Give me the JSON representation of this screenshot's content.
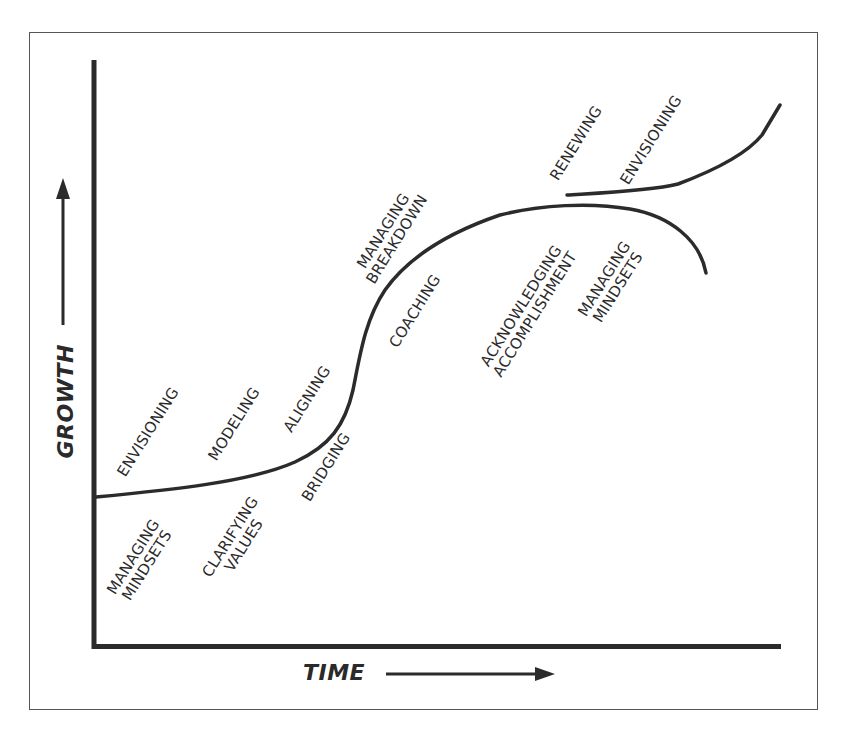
{
  "diagram": {
    "type": "growth-curve",
    "axes": {
      "x_label": "TIME",
      "y_label": "GROWTH"
    },
    "colors": {
      "ink": "#2b2b2b",
      "frame": "#555555",
      "background": "#ffffff"
    },
    "labels_above_curve": {
      "envisioning": "ENVISIONING",
      "modeling": "MODELING",
      "aligning": "ALIGNING",
      "managing_breakdown": [
        "MANAGING",
        "BREAKDOWN"
      ],
      "renewing": "RENEWING",
      "envisioning_2": "ENVISIONING"
    },
    "labels_below_curve": {
      "managing_mindsets": [
        "MANAGING",
        "MINDSETS"
      ],
      "clarifying_values": [
        "CLARIFYING",
        "VALUES"
      ],
      "bridging": "BRIDGING",
      "coaching": "COACHING",
      "acknowledging_accomplishment": [
        "ACKNOWLEDGING",
        "ACCOMPLISHMENT"
      ],
      "managing_mindsets_2": [
        "MANAGING",
        "MINDSETS"
      ]
    },
    "sequence": [
      "MANAGING MINDSETS",
      "ENVISIONING",
      "CLARIFYING VALUES",
      "MODELING",
      "ALIGNING",
      "BRIDGING",
      "MANAGING BREAKDOWN",
      "COACHING",
      "ACKNOWLEDGING ACCOMPLISHMENT",
      "RENEWING",
      "MANAGING MINDSETS",
      "ENVISIONING"
    ]
  }
}
